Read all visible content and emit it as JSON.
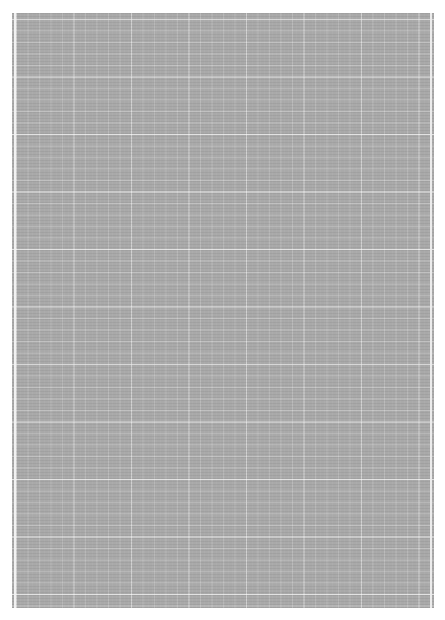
{
  "page": {
    "type": "grid-paper",
    "background_color": "#ffffff",
    "sheet_color": "#a9a9a9",
    "grid_line_color": "#cfcfcf",
    "grid_spacing_px": 11.5,
    "text": ""
  }
}
